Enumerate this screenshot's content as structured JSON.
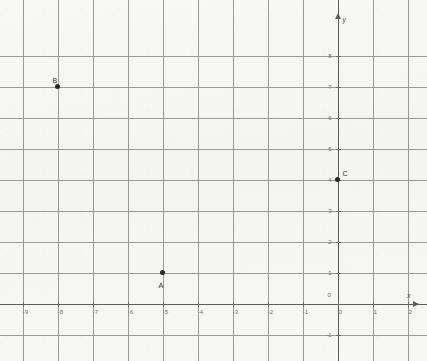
{
  "chart_data": {
    "type": "scatter",
    "title": "",
    "xlabel": "x",
    "ylabel": "y",
    "grid": true,
    "legend": "none",
    "xlim": [
      -9.6,
      2.6
    ],
    "ylim": [
      -1.6,
      8.6
    ],
    "x_ticks": [
      -9,
      -8,
      -7,
      -6,
      -5,
      -4,
      -3,
      -2,
      -1,
      0,
      1,
      2
    ],
    "y_ticks": [
      -1,
      0,
      1,
      2,
      3,
      4,
      5,
      6,
      7,
      8
    ],
    "x_tick_labels": [
      "-9",
      "-8",
      "-7",
      "-6",
      "-5",
      "-4",
      "-3",
      "-2",
      "-1",
      "0",
      "1",
      "2"
    ],
    "y_tick_labels": [
      "-1",
      "0",
      "1",
      "2",
      "3",
      "4",
      "5",
      "6",
      "7",
      "8"
    ],
    "points": [
      {
        "label": "A",
        "x": -5,
        "y": 1,
        "label_dx": -4,
        "label_dy": 9
      },
      {
        "label": "B",
        "x": -8,
        "y": 7,
        "label_dx": -5,
        "label_dy": -10
      },
      {
        "label": "C",
        "x": 0,
        "y": 4,
        "label_dx": 5,
        "label_dy": -10
      }
    ]
  },
  "axes": {
    "x_axis_label": "x",
    "y_axis_label": "y",
    "origin_label": "0"
  }
}
